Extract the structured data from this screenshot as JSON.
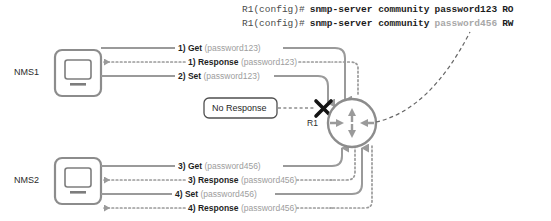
{
  "diagram": {
    "colors": {
      "line_gray": "#9a9a9a",
      "device_border": "#8c8c8c",
      "text_dark": "#1f1f1f",
      "text_light": "#9d9d9d",
      "block_x": "#1a1a1a"
    }
  },
  "cli": {
    "lines": [
      {
        "prompt": "R1(config)#",
        "command": "snmp-server community",
        "password": "password123",
        "password_style": "dark",
        "mode": "RO"
      },
      {
        "prompt": "R1(config)#",
        "command": "snmp-server community",
        "password": "password456",
        "password_style": "light",
        "mode": "RW"
      }
    ]
  },
  "nodes": [
    {
      "id": "nms1",
      "label": "NMS1",
      "icon": "computer-monitor-icon"
    },
    {
      "id": "nms2",
      "label": "NMS2",
      "icon": "computer-monitor-icon"
    },
    {
      "id": "r1",
      "label": "R1",
      "icon": "router-icon"
    }
  ],
  "callout": {
    "label": "No Response",
    "blocked_icon": "x-block-icon"
  },
  "flows": [
    {
      "id": "flow-1-get",
      "num": "1) Get",
      "password": "(password123)",
      "style": "solid",
      "direction": "to-router"
    },
    {
      "id": "flow-1-response",
      "num": "1) Response",
      "password": "(password123)",
      "style": "dotted",
      "direction": "to-nms"
    },
    {
      "id": "flow-2-set",
      "num": "2) Set",
      "password": "(password123)",
      "style": "solid",
      "direction": "to-router"
    },
    {
      "id": "flow-3-get",
      "num": "3) Get",
      "password": "(password456)",
      "style": "solid",
      "direction": "to-router"
    },
    {
      "id": "flow-3-response",
      "num": "3) Response",
      "password": "(password456)",
      "style": "dotted",
      "direction": "to-nms"
    },
    {
      "id": "flow-4-set",
      "num": "4) Set",
      "password": "(password456)",
      "style": "solid",
      "direction": "to-router"
    },
    {
      "id": "flow-4-response",
      "num": "4) Response",
      "password": "(password456)",
      "style": "dotted",
      "direction": "to-nms"
    }
  ]
}
